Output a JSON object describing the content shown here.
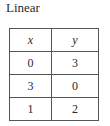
{
  "title": "Linear",
  "table": {
    "headers": [
      "x",
      "y"
    ],
    "rows": [
      [
        "0",
        "3"
      ],
      [
        "3",
        "0"
      ],
      [
        "1",
        "2"
      ]
    ]
  }
}
